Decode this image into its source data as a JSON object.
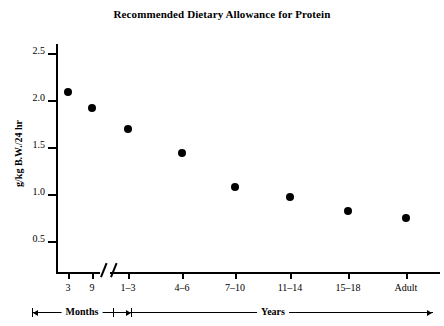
{
  "chart_data": {
    "type": "scatter",
    "title": "Recommended Dietary Allowance for Protein",
    "xlabel": "",
    "ylabel": "g/kg B.W./24 hr",
    "categories": [
      "3",
      "9",
      "1–3",
      "4–6",
      "7–10",
      "11–14",
      "15–18",
      "Adult"
    ],
    "values": [
      2.08,
      1.92,
      1.69,
      1.44,
      1.07,
      0.97,
      0.82,
      0.74
    ],
    "ylim": [
      0.25,
      2.65
    ],
    "yticks": [
      "0.5",
      "1.0",
      "1.5",
      "2.0",
      "2.5"
    ],
    "ytick_values": [
      0.5,
      1.0,
      1.5,
      2.0,
      2.5
    ],
    "grid": false,
    "legend": null,
    "axis_break": true,
    "marker_color": "#000000",
    "axis_color": "#000000",
    "groups": [
      {
        "label": "Months",
        "categories": [
          "3",
          "9"
        ]
      },
      {
        "label": "Years",
        "categories": [
          "1–3",
          "4–6",
          "7–10",
          "11–14",
          "15–18",
          "Adult"
        ]
      }
    ]
  },
  "chart": {
    "title": "Recommended Dietary Allowance for Protein",
    "y_axis_title": "g/kg B.W./24 hr",
    "y_tick_labels": [
      "2.5",
      "2.0",
      "1.5",
      "1.0",
      "0.5"
    ],
    "x_tick_labels": [
      "3",
      "9",
      "1–3",
      "4–6",
      "7–10",
      "11–14",
      "15–18",
      "Adult"
    ],
    "group_labels": {
      "months": "Months",
      "years": "Years"
    }
  }
}
